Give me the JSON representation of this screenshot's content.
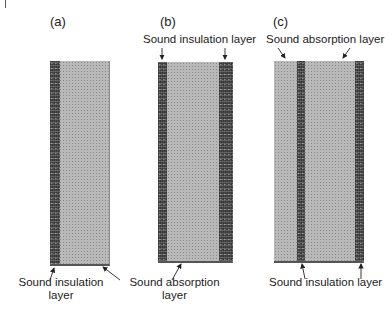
{
  "figure": {
    "panels": [
      {
        "id": "a",
        "label": "(a)",
        "top_labels": [],
        "bottom_labels": [
          {
            "line1": "Sound insulation",
            "line2": "layer"
          },
          {
            "line1": "Sound absorption",
            "line2": "layer"
          }
        ]
      },
      {
        "id": "b",
        "label": "(b)",
        "top_labels": [
          {
            "text": "Sound insulation layer"
          }
        ],
        "bottom_labels": []
      },
      {
        "id": "c",
        "label": "(c)",
        "top_labels": [
          {
            "text": "Sound absorption layer"
          }
        ],
        "bottom_labels": [
          {
            "text": "Sound insulation layer"
          }
        ]
      }
    ],
    "legend": {
      "dark_band": "Sound insulation layer",
      "light_fill": "Sound absorption layer"
    },
    "colors": {
      "absorption_fill": "#b9b9b9",
      "insulation_fill": "#4a4a4a",
      "arrow": "#222222"
    }
  }
}
